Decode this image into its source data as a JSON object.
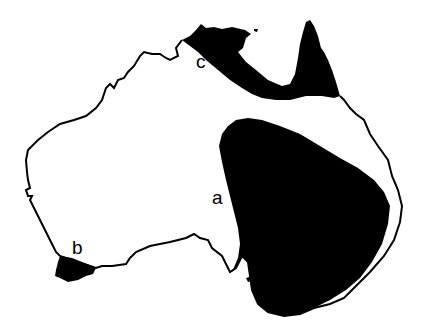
{
  "map": {
    "subject": "Australia",
    "outline_color": "#000000",
    "fill_color": "#000000",
    "background": "#ffffff",
    "regions": [
      {
        "id": "a",
        "label": "a",
        "description": "large shaded region in eastern/south-eastern interior"
      },
      {
        "id": "b",
        "label": "b",
        "description": "small shaded region at south-western tip"
      },
      {
        "id": "c",
        "label": "c",
        "description": "shaded band along northern coast and Cape York"
      }
    ]
  }
}
